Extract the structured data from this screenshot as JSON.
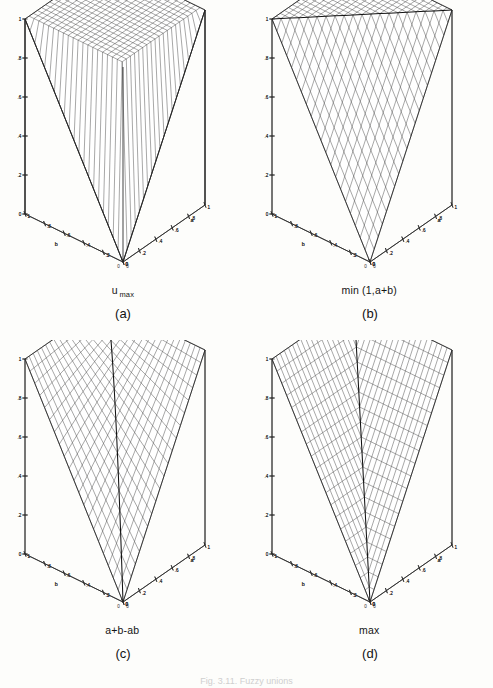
{
  "figure": {
    "caption": "Fig. 3.11.  Fuzzy unions",
    "panel_count": 4,
    "axes": {
      "x_name": "a",
      "y_name": "b",
      "z_name": "",
      "x_ticks": [
        "0",
        ".2",
        ".4",
        ".6",
        ".8",
        "1"
      ],
      "y_ticks": [
        "0",
        ".2",
        ".4",
        ".6",
        ".8",
        "1"
      ],
      "z_ticks": [
        "0",
        ".2",
        ".4",
        ".6",
        ".8",
        "1"
      ],
      "x_range": [
        0,
        1
      ],
      "y_range": [
        0,
        1
      ],
      "z_range": [
        0,
        1
      ],
      "origin_label": "0"
    },
    "panels": [
      {
        "letter": "(a)",
        "expression_main": "u",
        "expression_sub": "max",
        "surface": "umax",
        "description": "drastic union, flat plateau at 1 over the open unit square"
      },
      {
        "letter": "(b)",
        "expression_main": "min (1,a+b)",
        "expression_sub": "",
        "surface": "bounded_sum",
        "description": "bounded sum min(1, a+b), planar ramp clipped at 1"
      },
      {
        "letter": "(c)",
        "expression_main": "a+b-ab",
        "expression_sub": "",
        "surface": "algebraic_sum",
        "description": "algebraic sum a+b-ab, smooth saddle-like surface"
      },
      {
        "letter": "(d)",
        "expression_main": "max",
        "expression_sub": "",
        "surface": "max",
        "description": "standard fuzzy union max(a,b), two planar sheets meeting at the a=b crease"
      }
    ]
  },
  "chart_data": [
    {
      "type": "surface",
      "title": "u max",
      "xlabel": "a",
      "ylabel": "b",
      "zlabel": "",
      "xlim": [
        0,
        1
      ],
      "ylim": [
        0,
        1
      ],
      "zlim": [
        0,
        1
      ],
      "xticks": [
        0,
        0.2,
        0.4,
        0.6,
        0.8,
        1
      ],
      "yticks": [
        0,
        0.2,
        0.4,
        0.6,
        0.8,
        1
      ],
      "zticks": [
        0,
        0.2,
        0.4,
        0.6,
        0.8,
        1
      ],
      "formula": "u_max(a,b) = 1 if a>0 and b>0, else max(a,b)",
      "grid": true,
      "mesh_n": 20,
      "corner_values": {
        "a0_b0": 0,
        "a1_b0": 1,
        "a0_b1": 1,
        "a1_b1": 1
      }
    },
    {
      "type": "surface",
      "title": "min (1,a+b)",
      "xlabel": "a",
      "ylabel": "b",
      "zlabel": "",
      "xlim": [
        0,
        1
      ],
      "ylim": [
        0,
        1
      ],
      "zlim": [
        0,
        1
      ],
      "xticks": [
        0,
        0.2,
        0.4,
        0.6,
        0.8,
        1
      ],
      "yticks": [
        0,
        0.2,
        0.4,
        0.6,
        0.8,
        1
      ],
      "zticks": [
        0,
        0.2,
        0.4,
        0.6,
        0.8,
        1
      ],
      "formula": "min(1, a+b)",
      "grid": true,
      "mesh_n": 20,
      "corner_values": {
        "a0_b0": 0,
        "a1_b0": 1,
        "a0_b1": 1,
        "a1_b1": 1
      }
    },
    {
      "type": "surface",
      "title": "a+b-ab",
      "xlabel": "a",
      "ylabel": "b",
      "zlabel": "",
      "xlim": [
        0,
        1
      ],
      "ylim": [
        0,
        1
      ],
      "zlim": [
        0,
        1
      ],
      "xticks": [
        0,
        0.2,
        0.4,
        0.6,
        0.8,
        1
      ],
      "yticks": [
        0,
        0.2,
        0.4,
        0.6,
        0.8,
        1
      ],
      "zticks": [
        0,
        0.2,
        0.4,
        0.6,
        0.8,
        1
      ],
      "formula": "a + b - a*b",
      "grid": true,
      "mesh_n": 20,
      "corner_values": {
        "a0_b0": 0,
        "a1_b0": 1,
        "a0_b1": 1,
        "a1_b1": 1
      }
    },
    {
      "type": "surface",
      "title": "max",
      "xlabel": "a",
      "ylabel": "b",
      "zlabel": "",
      "xlim": [
        0,
        1
      ],
      "ylim": [
        0,
        1
      ],
      "zlim": [
        0,
        1
      ],
      "xticks": [
        0,
        0.2,
        0.4,
        0.6,
        0.8,
        1
      ],
      "yticks": [
        0,
        0.2,
        0.4,
        0.6,
        0.8,
        1
      ],
      "zticks": [
        0,
        0.2,
        0.4,
        0.6,
        0.8,
        1
      ],
      "formula": "max(a, b)",
      "grid": true,
      "mesh_n": 20,
      "corner_values": {
        "a0_b0": 0,
        "a1_b0": 1,
        "a0_b1": 1,
        "a1_b1": 1
      }
    }
  ]
}
